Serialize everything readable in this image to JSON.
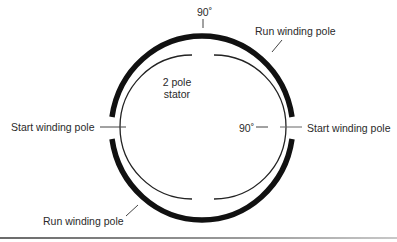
{
  "diagram": {
    "title_label": "2 pole",
    "title_label_2": "stator",
    "labels": {
      "top_angle": "90˚",
      "right_angle": "90˚",
      "run_top": "Run winding pole",
      "run_bottom": "Run winding pole",
      "start_left": "Start winding pole",
      "start_right": "Start winding pole"
    },
    "colors": {
      "outer_ring": "#111111",
      "inner_ring": "#222222",
      "leader": "#444444",
      "text": "#2a2a2a"
    }
  }
}
